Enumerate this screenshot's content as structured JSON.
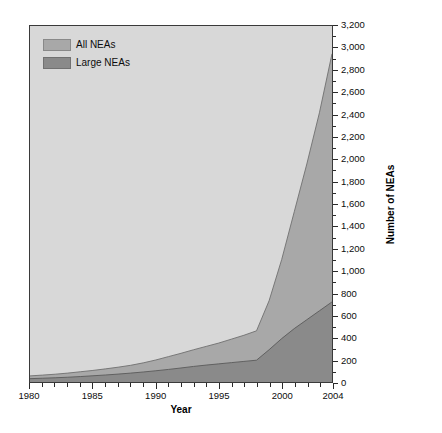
{
  "chart_data": {
    "type": "area",
    "title": "",
    "subtitle": "",
    "xlabel": "Year",
    "ylabel": "Number of NEAs",
    "xlim": [
      1980,
      2004
    ],
    "ylim": [
      0,
      3200
    ],
    "grid": false,
    "stacked": false,
    "legend_position": "top-left",
    "x": [
      1980,
      1981,
      1982,
      1983,
      1984,
      1985,
      1986,
      1987,
      1988,
      1989,
      1990,
      1991,
      1992,
      1993,
      1994,
      1995,
      1996,
      1997,
      1998,
      1999,
      2000,
      2001,
      2002,
      2003,
      2004
    ],
    "series": [
      {
        "name": "All NEAs",
        "color": "#a8a8a8",
        "values": [
          55,
          62,
          70,
          80,
          92,
          104,
          118,
          133,
          150,
          172,
          198,
          228,
          258,
          290,
          320,
          350,
          385,
          420,
          460,
          730,
          1100,
          1530,
          1960,
          2420,
          2950
        ]
      },
      {
        "name": "Large NEAs",
        "color": "#8a8a8a",
        "values": [
          30,
          34,
          38,
          43,
          49,
          56,
          63,
          71,
          80,
          90,
          101,
          113,
          126,
          140,
          152,
          163,
          174,
          185,
          196,
          290,
          390,
          480,
          560,
          640,
          720
        ]
      }
    ],
    "xticks": [
      {
        "value": 1980,
        "label": "1980",
        "major": true
      },
      {
        "value": 1981,
        "label": "",
        "major": false
      },
      {
        "value": 1982,
        "label": "",
        "major": false
      },
      {
        "value": 1983,
        "label": "",
        "major": false
      },
      {
        "value": 1984,
        "label": "",
        "major": false
      },
      {
        "value": 1985,
        "label": "1985",
        "major": true
      },
      {
        "value": 1986,
        "label": "",
        "major": false
      },
      {
        "value": 1987,
        "label": "",
        "major": false
      },
      {
        "value": 1988,
        "label": "",
        "major": false
      },
      {
        "value": 1989,
        "label": "",
        "major": false
      },
      {
        "value": 1990,
        "label": "1990",
        "major": true
      },
      {
        "value": 1991,
        "label": "",
        "major": false
      },
      {
        "value": 1992,
        "label": "",
        "major": false
      },
      {
        "value": 1993,
        "label": "",
        "major": false
      },
      {
        "value": 1994,
        "label": "",
        "major": false
      },
      {
        "value": 1995,
        "label": "1995",
        "major": true
      },
      {
        "value": 1996,
        "label": "",
        "major": false
      },
      {
        "value": 1997,
        "label": "",
        "major": false
      },
      {
        "value": 1998,
        "label": "",
        "major": false
      },
      {
        "value": 1999,
        "label": "",
        "major": false
      },
      {
        "value": 2000,
        "label": "2000",
        "major": true
      },
      {
        "value": 2001,
        "label": "",
        "major": false
      },
      {
        "value": 2002,
        "label": "",
        "major": false
      },
      {
        "value": 2003,
        "label": "",
        "major": false
      },
      {
        "value": 2004,
        "label": "2004",
        "major": true
      }
    ],
    "yticks": [
      {
        "value": 0,
        "label": "0"
      },
      {
        "value": 200,
        "label": "200"
      },
      {
        "value": 400,
        "label": "400"
      },
      {
        "value": 600,
        "label": "600"
      },
      {
        "value": 800,
        "label": "800"
      },
      {
        "value": 1000,
        "label": "1,000"
      },
      {
        "value": 1200,
        "label": "1,200"
      },
      {
        "value": 1400,
        "label": "1,400"
      },
      {
        "value": 1600,
        "label": "1,600"
      },
      {
        "value": 1800,
        "label": "1,800"
      },
      {
        "value": 2000,
        "label": "2,000"
      },
      {
        "value": 2200,
        "label": "2,200"
      },
      {
        "value": 2400,
        "label": "2,400"
      },
      {
        "value": 2600,
        "label": "2,600"
      },
      {
        "value": 2800,
        "label": "2,800"
      },
      {
        "value": 3000,
        "label": "3,000"
      },
      {
        "value": 3200,
        "label": "3,200"
      }
    ],
    "legend": [
      {
        "label": "All NEAs",
        "color": "#a8a8a8"
      },
      {
        "label": "Large NEAs",
        "color": "#8a8a8a"
      }
    ],
    "colors": {
      "plot_background": "#d8d8d8",
      "all_neas": "#a8a8a8",
      "large_neas": "#8a8a8a",
      "axis": "#2a2a2a",
      "text": "#0d0d0d"
    }
  }
}
